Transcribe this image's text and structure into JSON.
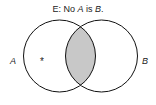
{
  "diagram": {
    "title_prefix": "E:  No ",
    "title_a": "A",
    "title_mid": " is ",
    "title_b": "B",
    "title_suffix": ".",
    "label_a": "A",
    "label_b": "B",
    "marker": "*",
    "shade_color": "#c8c8c8"
  }
}
